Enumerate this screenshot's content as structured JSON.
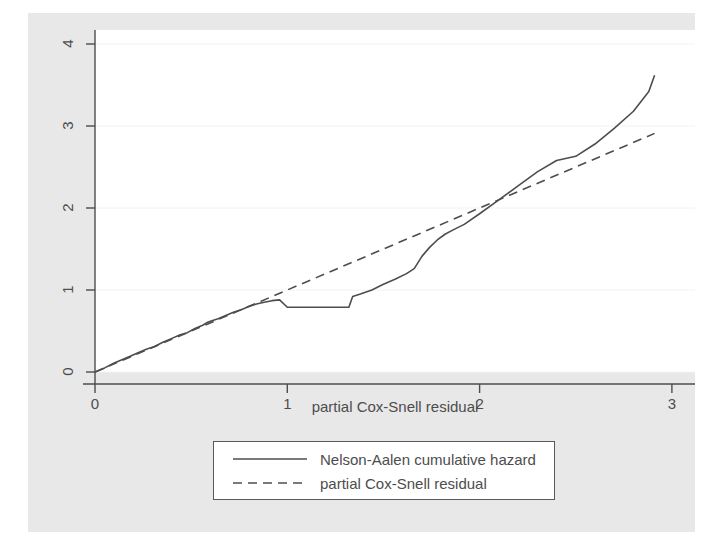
{
  "chart_data": {
    "type": "line",
    "title": "",
    "subtitle": "",
    "xlabel": "partial Cox-Snell residual",
    "ylabel": "",
    "xlim": [
      0,
      3.12
    ],
    "ylim": [
      0,
      4.17
    ],
    "xticks": [
      0,
      1,
      2,
      3
    ],
    "xtick_labels": [
      "0",
      "1",
      "2",
      "3"
    ],
    "yticks": [
      0,
      1,
      2,
      3,
      4
    ],
    "ytick_labels": [
      "0",
      "1",
      "2",
      "3",
      "4"
    ],
    "grid": "horizontal",
    "legend_position": "below-center",
    "series": [
      {
        "name": "Nelson-Aalen cumulative hazard",
        "style": "solid",
        "color": "#4d4d4d",
        "points": [
          [
            0.0,
            0.0
          ],
          [
            0.05,
            0.05
          ],
          [
            0.1,
            0.11
          ],
          [
            0.14,
            0.15
          ],
          [
            0.18,
            0.19
          ],
          [
            0.23,
            0.24
          ],
          [
            0.27,
            0.28
          ],
          [
            0.31,
            0.31
          ],
          [
            0.35,
            0.36
          ],
          [
            0.4,
            0.41
          ],
          [
            0.44,
            0.45
          ],
          [
            0.48,
            0.48
          ],
          [
            0.52,
            0.53
          ],
          [
            0.56,
            0.57
          ],
          [
            0.58,
            0.6
          ],
          [
            0.6,
            0.62
          ],
          [
            0.64,
            0.65
          ],
          [
            0.68,
            0.69
          ],
          [
            0.72,
            0.73
          ],
          [
            0.76,
            0.76
          ],
          [
            0.8,
            0.8
          ],
          [
            0.84,
            0.83
          ],
          [
            0.88,
            0.85
          ],
          [
            0.92,
            0.87
          ],
          [
            0.96,
            0.88
          ],
          [
            1.0,
            0.79
          ],
          [
            1.05,
            0.79
          ],
          [
            1.1,
            0.79
          ],
          [
            1.15,
            0.79
          ],
          [
            1.2,
            0.79
          ],
          [
            1.26,
            0.79
          ],
          [
            1.32,
            0.79
          ],
          [
            1.34,
            0.92
          ],
          [
            1.38,
            0.95
          ],
          [
            1.44,
            1.0
          ],
          [
            1.5,
            1.07
          ],
          [
            1.56,
            1.13
          ],
          [
            1.62,
            1.2
          ],
          [
            1.66,
            1.26
          ],
          [
            1.7,
            1.41
          ],
          [
            1.74,
            1.52
          ],
          [
            1.78,
            1.61
          ],
          [
            1.82,
            1.68
          ],
          [
            1.86,
            1.73
          ],
          [
            1.92,
            1.8
          ],
          [
            2.0,
            1.93
          ],
          [
            2.1,
            2.1
          ],
          [
            2.2,
            2.27
          ],
          [
            2.3,
            2.44
          ],
          [
            2.4,
            2.58
          ],
          [
            2.5,
            2.63
          ],
          [
            2.6,
            2.78
          ],
          [
            2.7,
            2.97
          ],
          [
            2.8,
            3.18
          ],
          [
            2.88,
            3.42
          ],
          [
            2.91,
            3.62
          ]
        ]
      },
      {
        "name": "partial Cox-Snell residual",
        "style": "dashed",
        "color": "#4d4d4d",
        "points": [
          [
            0.0,
            0.0
          ],
          [
            2.91,
            2.91
          ]
        ]
      }
    ]
  },
  "axes": {
    "x_title": "partial Cox-Snell residual",
    "x_tick_labels": [
      "0",
      "1",
      "2",
      "3"
    ],
    "y_tick_labels": [
      "0",
      "1",
      "2",
      "3",
      "4"
    ]
  },
  "legend": {
    "entries": [
      {
        "label": "Nelson-Aalen cumulative hazard",
        "style": "solid"
      },
      {
        "label": "partial Cox-Snell residual",
        "style": "dashed"
      }
    ]
  },
  "colors": {
    "line": "#4d4d4d",
    "axis": "#4d4d4d",
    "grid": "#f2f2f2",
    "graph_region": "#e8e8e8",
    "plot_region": "#ffffff",
    "text": "#4d4d4d"
  }
}
